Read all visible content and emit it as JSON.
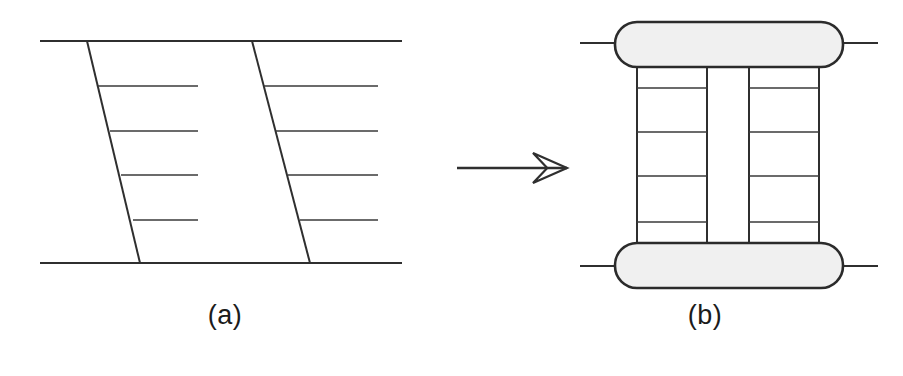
{
  "figure": {
    "width": 903,
    "height": 376,
    "background_color": "#ffffff",
    "ink_color": "#2f2f2f",
    "pad_fill_color": "#f0f0f0",
    "pad_stroke_color": "#2b2b2b",
    "caption_color": "#1b1b1b"
  },
  "captions": {
    "panel_a": "(a)",
    "panel_b": "(b)"
  },
  "arrow": {
    "name": "transform-arrow",
    "shaft_start_x": 457,
    "shaft_end_x": 567,
    "y": 168,
    "head_style": "open-chevron",
    "head_length": 34,
    "head_half_height": 15
  },
  "chart_data": {
    "type": "diagram",
    "title": "",
    "panels": [
      {
        "id": "a",
        "label": "(a)",
        "description": "Skewed ladder: two horizontal rails with two slanted stiles and slanted rungs",
        "bounds": {
          "x": 40,
          "y": 41,
          "width": 362,
          "height": 222
        },
        "rails": [
          {
            "name": "top-rail",
            "x1": 40,
            "y1": 41,
            "x2": 402,
            "y2": 41
          },
          {
            "name": "bottom-rail",
            "x1": 40,
            "y1": 263,
            "x2": 402,
            "y2": 263
          }
        ],
        "stiles": [
          {
            "name": "left-stile",
            "x1": 87,
            "y1": 41,
            "x2": 140,
            "y2": 263
          },
          {
            "name": "right-stile",
            "x1": 252,
            "y1": 41,
            "x2": 310,
            "y2": 263
          }
        ],
        "left_rungs": [
          {
            "x1": 98,
            "y1": 86,
            "x2": 198,
            "y2": 86
          },
          {
            "x1": 110,
            "y1": 131,
            "x2": 198,
            "y2": 131
          },
          {
            "x1": 121,
            "y1": 175,
            "x2": 198,
            "y2": 175
          },
          {
            "x1": 133,
            "y1": 220,
            "x2": 198,
            "y2": 220
          }
        ],
        "right_rungs": [
          {
            "x1": 264,
            "y1": 86,
            "x2": 378,
            "y2": 86
          },
          {
            "x1": 276,
            "y1": 131,
            "x2": 378,
            "y2": 131
          },
          {
            "x1": 288,
            "y1": 175,
            "x2": 378,
            "y2": 175
          },
          {
            "x1": 300,
            "y1": 220,
            "x2": 378,
            "y2": 220
          }
        ]
      },
      {
        "id": "b",
        "label": "(b)",
        "description": "Rectified ladder: two rounded-rectangle pads joined by four vertical stiles with horizontal rungs",
        "bounds": {
          "x": 580,
          "y": 22,
          "width": 298,
          "height": 266
        },
        "pads": [
          {
            "name": "top-pad",
            "x": 615,
            "y": 22,
            "width": 228,
            "height": 45,
            "corner_radius": 22
          },
          {
            "name": "bottom-pad",
            "x": 615,
            "y": 243,
            "width": 228,
            "height": 45,
            "corner_radius": 22
          }
        ],
        "pad_leads": [
          {
            "name": "top-left-lead",
            "x1": 580,
            "y1": 43,
            "x2": 617,
            "y2": 43
          },
          {
            "name": "top-right-lead",
            "x1": 841,
            "y1": 43,
            "x2": 878,
            "y2": 43
          },
          {
            "name": "bottom-left-lead",
            "x1": 580,
            "y1": 266,
            "x2": 617,
            "y2": 266
          },
          {
            "name": "bottom-right-lead",
            "x1": 841,
            "y1": 266,
            "x2": 878,
            "y2": 266
          }
        ],
        "stiles": [
          {
            "name": "stile-1",
            "x": 637,
            "y1": 67,
            "y2": 243
          },
          {
            "name": "stile-2",
            "x": 707,
            "y1": 67,
            "y2": 243
          },
          {
            "name": "stile-3",
            "x": 749,
            "y1": 67,
            "y2": 243
          },
          {
            "name": "stile-4",
            "x": 819,
            "y1": 67,
            "y2": 243
          }
        ],
        "left_rungs": [
          {
            "x1": 637,
            "y1": 88,
            "x2": 707,
            "y2": 88
          },
          {
            "x1": 637,
            "y1": 132,
            "x2": 707,
            "y2": 132
          },
          {
            "x1": 637,
            "y1": 176,
            "x2": 707,
            "y2": 176
          },
          {
            "x1": 637,
            "y1": 222,
            "x2": 707,
            "y2": 222
          }
        ],
        "right_rungs": [
          {
            "x1": 749,
            "y1": 88,
            "x2": 819,
            "y2": 88
          },
          {
            "x1": 749,
            "y1": 132,
            "x2": 819,
            "y2": 132
          },
          {
            "x1": 749,
            "y1": 176,
            "x2": 819,
            "y2": 176
          },
          {
            "x1": 749,
            "y1": 222,
            "x2": 819,
            "y2": 222
          }
        ]
      }
    ]
  }
}
